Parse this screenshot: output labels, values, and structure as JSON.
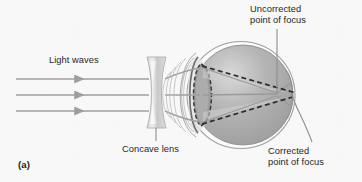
{
  "figure": {
    "panel_label": "(a)",
    "caption_labels": {
      "light_waves": "Light waves",
      "concave_lens": "Concave lens",
      "uncorrected": "Uncorrected\npoint of focus",
      "corrected": "Corrected\npoint of focus"
    },
    "colors": {
      "background": "#f8f8f8",
      "text": "#1f1f1f",
      "ray": "#a0a0a0",
      "leader": "#8e8e8e",
      "dashed": "#2b2b2b",
      "sclera_outline": "#9a9a9a",
      "eyeball_fill": "#a9a9a9",
      "eyeball_light": "#d6d6d6",
      "lens_fill": "#c8c8c8",
      "lens_outline": "#b0b0b0",
      "cornea_outline": "#2f2f2f",
      "eye_lens_fill": "#9e9e9e"
    },
    "geometry": {
      "ray_y_values": [
        79,
        95,
        111
      ],
      "ray_start_x": 16,
      "arrowhead_x": 85,
      "lens_x_center": 156,
      "lens_top": 57,
      "lens_bottom": 128,
      "eye_center_x": 240,
      "eye_center_y": 95,
      "eye_radius_x": 53,
      "eye_radius_y": 53,
      "uncorrected_focus_x": 277,
      "uncorrected_focus_y": 93,
      "corrected_focus_x": 290,
      "corrected_focus_y": 94
    },
    "elements": {
      "incoming_rays": "three parallel horizontal light rays with arrowheads",
      "concave_lens": "biconcave hourglass lens",
      "eyeball": "eye with sclera, cornea, crystalline lens and retina",
      "solid_rays": "refracted rays converging at uncorrected point of focus",
      "dashed_rays": "corrected ray paths converging on the retina"
    }
  }
}
